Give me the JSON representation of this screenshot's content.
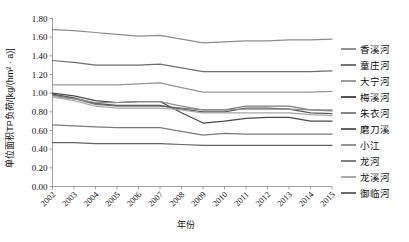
{
  "chart_data": {
    "type": "line",
    "title": "",
    "xlabel": "年份",
    "ylabel": "单位面积TP负荷/[kg/(hm² · a)]",
    "grid": false,
    "legend_position": "right",
    "xlim": [
      2002,
      2015
    ],
    "ylim": [
      0.0,
      1.8
    ],
    "ytick_labels": [
      "0.00",
      "0.20",
      "0.40",
      "0.60",
      "0.80",
      "1.00",
      "1.20",
      "1.40",
      "1.60",
      "1.80"
    ],
    "ytick_values": [
      0.0,
      0.2,
      0.4,
      0.6,
      0.8,
      1.0,
      1.2,
      1.4,
      1.6,
      1.8
    ],
    "categories": [
      2002,
      2003,
      2004,
      2005,
      2006,
      2007,
      2008,
      2009,
      2010,
      2011,
      2012,
      2013,
      2014,
      2015
    ],
    "xtick_labels": [
      "2002",
      "2003",
      "2004",
      "2005",
      "2006",
      "2007",
      "2008",
      "2009",
      "2010",
      "2011",
      "2012",
      "2013",
      "2014",
      "2015"
    ],
    "series": [
      {
        "name": "香溪河",
        "color": "#8c8c8c",
        "values": [
          1.68,
          1.67,
          1.65,
          1.63,
          1.61,
          1.62,
          1.58,
          1.54,
          1.55,
          1.56,
          1.56,
          1.57,
          1.57,
          1.58
        ]
      },
      {
        "name": "童庄河",
        "color": "#6e6e6e",
        "values": [
          1.35,
          1.33,
          1.3,
          1.3,
          1.3,
          1.31,
          1.27,
          1.23,
          1.23,
          1.23,
          1.23,
          1.23,
          1.23,
          1.24
        ]
      },
      {
        "name": "大宁河",
        "color": "#969696",
        "values": [
          1.09,
          1.09,
          1.09,
          1.09,
          1.1,
          1.11,
          1.06,
          1.01,
          1.01,
          1.01,
          1.01,
          1.01,
          1.01,
          1.02
        ]
      },
      {
        "name": "梅溪河",
        "color": "#4a4a4a",
        "values": [
          1.0,
          0.97,
          0.92,
          0.9,
          0.91,
          0.91,
          0.79,
          0.68,
          0.7,
          0.73,
          0.74,
          0.74,
          0.7,
          0.7
        ]
      },
      {
        "name": "朱衣河",
        "color": "#7d7d7d",
        "values": [
          0.98,
          0.94,
          0.88,
          0.86,
          0.86,
          0.86,
          0.84,
          0.82,
          0.82,
          0.86,
          0.86,
          0.86,
          0.82,
          0.81
        ]
      },
      {
        "name": "磨刀溪",
        "color": "#5a5a5a",
        "values": [
          0.99,
          0.95,
          0.89,
          0.87,
          0.87,
          0.87,
          0.83,
          0.8,
          0.8,
          0.84,
          0.84,
          0.83,
          0.79,
          0.78
        ]
      },
      {
        "name": "小江",
        "color": "#8f8f8f",
        "values": [
          0.96,
          0.94,
          0.9,
          0.9,
          0.91,
          0.91,
          0.86,
          0.82,
          0.82,
          0.83,
          0.83,
          0.83,
          0.82,
          0.82
        ]
      },
      {
        "name": "龙河",
        "color": "#7a7a7a",
        "values": [
          0.66,
          0.65,
          0.64,
          0.63,
          0.63,
          0.63,
          0.59,
          0.55,
          0.57,
          0.56,
          0.56,
          0.56,
          0.56,
          0.56
        ]
      },
      {
        "name": "龙溪河",
        "color": "#a8a8a8",
        "values": [
          0.96,
          0.92,
          0.86,
          0.84,
          0.84,
          0.84,
          0.82,
          0.79,
          0.79,
          0.79,
          0.79,
          0.79,
          0.77,
          0.76
        ]
      },
      {
        "name": "御临河",
        "color": "#636363",
        "values": [
          0.47,
          0.47,
          0.46,
          0.46,
          0.46,
          0.46,
          0.45,
          0.44,
          0.44,
          0.44,
          0.44,
          0.44,
          0.44,
          0.44
        ]
      }
    ]
  }
}
